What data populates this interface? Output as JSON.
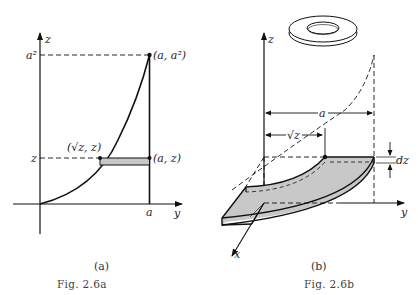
{
  "figure_a": {
    "axis_z_label": "z",
    "axis_y_label": "y",
    "tick_a2": "a²",
    "tick_z": "z",
    "tick_a": "a",
    "point_top": "(a, a²)",
    "point_curve": "(√z, z)",
    "point_right": "(a, z)",
    "sublabel": "(a)",
    "caption": "Fig. 2.6a"
  },
  "figure_b": {
    "axis_z_label": "z",
    "axis_y_label": "y",
    "axis_x_label": "x",
    "dim_a": "a",
    "dim_sqrt_z": "√z",
    "dim_dz": "dz",
    "sublabel": "(b)",
    "caption": "Fig. 2.6b",
    "inset": "washer-shaped disk"
  },
  "colors": {
    "ink": "#111111",
    "fill_gray": "#c8c8c8",
    "background": "#ffffff"
  }
}
